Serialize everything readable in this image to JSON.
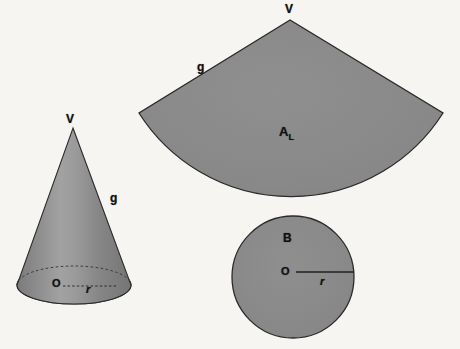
{
  "figure": {
    "background_color": "#f6f5f2",
    "fill_color": "#8a8a8a",
    "stroke_color": "#2a2a2a",
    "label_color": "#121212"
  },
  "cone": {
    "name": "cone-solid",
    "apex_label": "V",
    "slant_label": "g",
    "center_label": "O",
    "radius_label": "r",
    "apex_point": {
      "x": 73,
      "y": 128
    },
    "base_center": {
      "x": 74,
      "y": 285
    },
    "base_rx": 57,
    "base_ry": 19
  },
  "sector": {
    "name": "lateral-surface-sector",
    "apex_label": "V",
    "slant_label": "g",
    "area_label": "A",
    "area_subscript": "L",
    "apex_point": {
      "x": 290,
      "y": 20
    },
    "left_corner": {
      "x": 139,
      "y": 113
    },
    "right_corner": {
      "x": 443,
      "y": 113
    },
    "arc_bottom": {
      "x": 290,
      "y": 215
    },
    "radius": 180
  },
  "base_circle": {
    "name": "base-circle",
    "area_label": "B",
    "center_label": "O",
    "radius_label": "r",
    "center": {
      "x": 293,
      "y": 277
    },
    "radius": 61
  }
}
